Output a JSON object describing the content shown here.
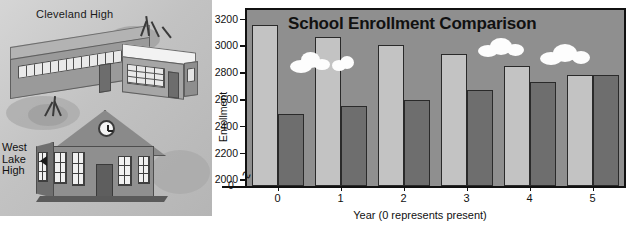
{
  "illustration": {
    "label_cleveland": "Cleveland High",
    "label_westlake_line1": "West",
    "label_westlake_line2": "Lake",
    "label_westlake_line3": "High"
  },
  "chart_data": {
    "type": "bar",
    "title": "School Enrollment Comparison",
    "xlabel": "Year (0 represents present)",
    "ylabel": "Enrollment",
    "categories": [
      "0",
      "1",
      "2",
      "3",
      "4",
      "5"
    ],
    "yticks": [
      2000,
      2200,
      2400,
      2600,
      2800,
      3000,
      3200
    ],
    "ylim": [
      1950,
      3280
    ],
    "axis_break": true,
    "origin_label": "0",
    "grid": false,
    "legend": "none",
    "series": [
      {
        "name": "Cleveland High",
        "color": "#c3c3c3",
        "values": [
          3150,
          3060,
          3000,
          2940,
          2850,
          2780
        ]
      },
      {
        "name": "West Lake High",
        "color": "#6e6e6e",
        "values": [
          2490,
          2550,
          2590,
          2670,
          2730,
          2780
        ]
      }
    ]
  },
  "colors": {
    "light_bar": "#c3c3c3",
    "dark_bar": "#6e6e6e",
    "plot_background": "#8f8f8f",
    "axis": "#111111",
    "cloud": "#fdfdfd"
  }
}
